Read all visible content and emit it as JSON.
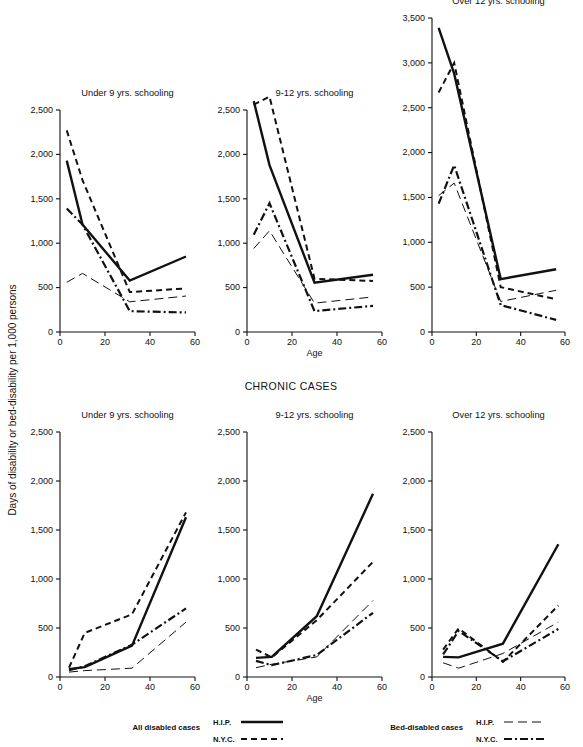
{
  "figure": {
    "ylabel": "Days of disability or bed-disability per 1,000 persons",
    "xlabel": "Age",
    "section_title_chronic": "CHRONIC CASES"
  },
  "legend": {
    "groups": [
      {
        "name": "All disabled cases",
        "entries": [
          {
            "label": "H.I.P.",
            "style": "solid-thick"
          },
          {
            "label": "N.Y.C.",
            "style": "dashed-thick"
          }
        ]
      },
      {
        "name": "Bed-disabled cases",
        "entries": [
          {
            "label": "H.I.P.",
            "style": "longdash-thin"
          },
          {
            "label": "N.Y.C.",
            "style": "dashdot-thick"
          }
        ]
      }
    ]
  },
  "series_styles": {
    "all_hip": {
      "name": "All disabled cases — H.I.P.",
      "dash": "none",
      "width": 2.4
    },
    "all_nyc": {
      "name": "All disabled cases — N.Y.C.",
      "dash": "6,4",
      "width": 2.0
    },
    "bed_hip": {
      "name": "Bed-disabled cases — H.I.P.",
      "dash": "9,5",
      "width": 1.0
    },
    "bed_nyc": {
      "name": "Bed-disabled cases — N.Y.C.",
      "dash": "8,3,2,3",
      "width": 2.2
    }
  },
  "chart_data": [
    {
      "id": "top-under9",
      "type": "line",
      "title": "Under 9 yrs. schooling",
      "row": "acute",
      "xlabel": "",
      "ylabel": "",
      "xlim": [
        0,
        60
      ],
      "ylim": [
        0,
        2500
      ],
      "xticks": [
        0,
        20,
        40,
        60
      ],
      "yticks": [
        0,
        500,
        1000,
        1500,
        2000,
        2500
      ],
      "ytick_labels": [
        "0",
        "500",
        "1,000",
        "1,500",
        "2,000",
        "2,500"
      ],
      "grid": false,
      "x": [
        3,
        10,
        31,
        56
      ],
      "series": [
        {
          "key": "all_hip",
          "name": "All disabled cases — H.I.P.",
          "values": [
            1930,
            1210,
            580,
            850
          ]
        },
        {
          "key": "all_nyc",
          "name": "All disabled cases — N.Y.C.",
          "values": [
            2270,
            1710,
            450,
            490
          ]
        },
        {
          "key": "bed_hip",
          "name": "Bed-disabled cases — H.I.P.",
          "values": [
            560,
            660,
            340,
            405
          ]
        },
        {
          "key": "bed_nyc",
          "name": "Bed-disabled cases — N.Y.C.",
          "values": [
            1390,
            1210,
            235,
            220
          ]
        }
      ]
    },
    {
      "id": "top-9to12",
      "type": "line",
      "title": "9-12 yrs. schooling",
      "row": "acute",
      "xlabel": "Age",
      "ylabel": "",
      "xlim": [
        0,
        60
      ],
      "ylim": [
        0,
        2500
      ],
      "xticks": [
        0,
        20,
        40,
        60
      ],
      "yticks": [
        0,
        500,
        1000,
        1500,
        2000,
        2500
      ],
      "ytick_labels": [
        "0",
        "500",
        "1,000",
        "1,500",
        "2,000",
        "2,500"
      ],
      "grid": false,
      "x": [
        3,
        10,
        30,
        56
      ],
      "series": [
        {
          "key": "all_hip",
          "name": "All disabled cases — H.I.P.",
          "values": [
            2600,
            1880,
            555,
            645
          ]
        },
        {
          "key": "all_nyc",
          "name": "All disabled cases — N.Y.C.",
          "values": [
            2560,
            2650,
            600,
            575
          ]
        },
        {
          "key": "bed_hip",
          "name": "Bed-disabled cases — H.I.P.",
          "values": [
            940,
            1140,
            325,
            395
          ]
        },
        {
          "key": "bed_nyc",
          "name": "Bed-disabled cases — N.Y.C.",
          "values": [
            1095,
            1450,
            235,
            295
          ]
        }
      ]
    },
    {
      "id": "top-over12",
      "type": "line",
      "title": "Over 12 yrs. schooling",
      "row": "acute",
      "xlabel": "",
      "ylabel": "",
      "xlim": [
        0,
        60
      ],
      "ylim": [
        0,
        3500
      ],
      "xticks": [
        0,
        20,
        40,
        60
      ],
      "yticks": [
        0,
        500,
        1000,
        1500,
        2000,
        2500,
        3000,
        3500
      ],
      "ytick_labels": [
        "0",
        "500",
        "1,000",
        "1,500",
        "2,000",
        "2,500",
        "3,000",
        "3,500"
      ],
      "grid": false,
      "x": [
        3,
        10,
        31,
        56
      ],
      "series": [
        {
          "key": "all_hip",
          "name": "All disabled cases — H.I.P.",
          "values": [
            3390,
            2880,
            590,
            700
          ]
        },
        {
          "key": "all_nyc",
          "name": "All disabled cases — N.Y.C.",
          "values": [
            2670,
            3000,
            500,
            365
          ]
        },
        {
          "key": "bed_hip",
          "name": "Bed-disabled cases — H.I.P.",
          "values": [
            1520,
            1660,
            340,
            465
          ]
        },
        {
          "key": "bed_nyc",
          "name": "Bed-disabled cases — N.Y.C.",
          "values": [
            1430,
            1860,
            300,
            135
          ]
        }
      ]
    },
    {
      "id": "bottom-under9",
      "type": "line",
      "title": "Under 9 yrs. schooling",
      "row": "chronic",
      "xlabel": "",
      "ylabel": "",
      "xlim": [
        0,
        60
      ],
      "ylim": [
        0,
        2500
      ],
      "xticks": [
        0,
        20,
        40,
        60
      ],
      "yticks": [
        0,
        500,
        1000,
        1500,
        2000,
        2500
      ],
      "ytick_labels": [
        "0",
        "500",
        "1,000",
        "1,500",
        "2,000",
        "2,500"
      ],
      "grid": false,
      "x": [
        4,
        11,
        32,
        56
      ],
      "series": [
        {
          "key": "all_hip",
          "name": "All disabled cases — H.I.P.",
          "values": [
            80,
            100,
            320,
            1630
          ]
        },
        {
          "key": "all_nyc",
          "name": "All disabled cases — N.Y.C.",
          "values": [
            95,
            450,
            640,
            1680
          ]
        },
        {
          "key": "bed_hip",
          "name": "Bed-disabled cases — H.I.P.",
          "values": [
            50,
            65,
            90,
            560
          ]
        },
        {
          "key": "bed_nyc",
          "name": "Bed-disabled cases — N.Y.C.",
          "values": [
            70,
            110,
            330,
            700
          ]
        }
      ]
    },
    {
      "id": "bottom-9to12",
      "type": "line",
      "title": "9-12 yrs. schooling",
      "row": "chronic",
      "xlabel": "Age",
      "ylabel": "",
      "xlim": [
        0,
        60
      ],
      "ylim": [
        0,
        2500
      ],
      "xticks": [
        0,
        20,
        40,
        60
      ],
      "yticks": [
        0,
        500,
        1000,
        1500,
        2000,
        2500
      ],
      "ytick_labels": [
        "0",
        "500",
        "1,000",
        "1,500",
        "2,000",
        "2,500"
      ],
      "grid": false,
      "x": [
        4,
        11,
        31,
        56
      ],
      "series": [
        {
          "key": "all_hip",
          "name": "All disabled cases — H.I.P.",
          "values": [
            195,
            205,
            620,
            1870
          ]
        },
        {
          "key": "all_nyc",
          "name": "All disabled cases — N.Y.C.",
          "values": [
            280,
            200,
            580,
            1175
          ]
        },
        {
          "key": "bed_hip",
          "name": "Bed-disabled cases — H.I.P.",
          "values": [
            95,
            130,
            205,
            780
          ]
        },
        {
          "key": "bed_nyc",
          "name": "Bed-disabled cases — N.Y.C.",
          "values": [
            165,
            120,
            225,
            655
          ]
        }
      ]
    },
    {
      "id": "bottom-over12",
      "type": "line",
      "title": "Over 12 yrs. schooling",
      "row": "chronic",
      "xlabel": "",
      "ylabel": "",
      "xlim": [
        0,
        60
      ],
      "ylim": [
        0,
        2500
      ],
      "xticks": [
        0,
        20,
        40,
        60
      ],
      "yticks": [
        0,
        500,
        1000,
        1500,
        2000,
        2500
      ],
      "ytick_labels": [
        "0",
        "500",
        "1,000",
        "1,500",
        "2,000",
        "2,500"
      ],
      "grid": false,
      "x": [
        5,
        12,
        32,
        57
      ],
      "series": [
        {
          "key": "all_hip",
          "name": "All disabled cases — H.I.P.",
          "values": [
            205,
            200,
            340,
            1355
          ]
        },
        {
          "key": "all_nyc",
          "name": "All disabled cases — N.Y.C.",
          "values": [
            280,
            495,
            155,
            730
          ]
        },
        {
          "key": "bed_hip",
          "name": "Bed-disabled cases — H.I.P.",
          "values": [
            145,
            90,
            240,
            560
          ]
        },
        {
          "key": "bed_nyc",
          "name": "Bed-disabled cases — N.Y.C.",
          "values": [
            230,
            470,
            160,
            490
          ]
        }
      ]
    }
  ]
}
